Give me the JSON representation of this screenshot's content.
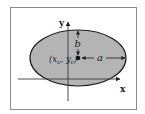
{
  "diagram": {
    "colors": {
      "background": "#ffffff",
      "border": "#8a8a8a",
      "ellipse_fill": "#b4b4b4",
      "ellipse_stroke": "#1e1e1e",
      "axis": "#3a3a3a"
    },
    "axes": {
      "x_label": "x",
      "y_label": "y"
    },
    "center_label": "(x",
    "center_label_xsub": "c",
    "center_label_mid": ", y",
    "center_label_ysub": "c",
    "center_label_close": ")",
    "semi_major_label": "a",
    "semi_minor_label": "b"
  }
}
